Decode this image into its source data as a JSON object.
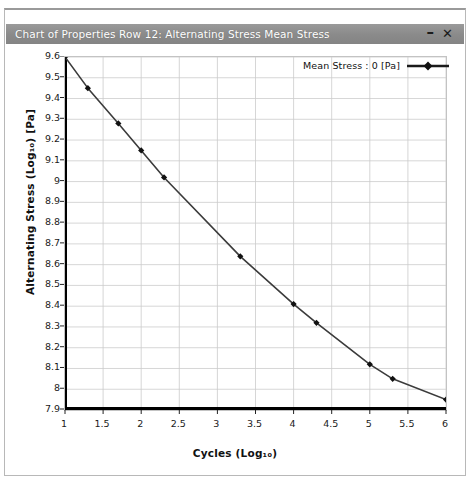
{
  "window": {
    "title": "Chart of Properties Row 12: Alternating Stress Mean Stress",
    "minimize_label": "–",
    "close_label": "✕"
  },
  "chart_data": {
    "type": "line",
    "title": "Chart of Properties Row 12: Alternating Stress Mean Stress",
    "xlabel": "Cycles (Log₁₀)",
    "ylabel": "Alternating Stress (Log₁₀) [Pa]",
    "xlim": [
      1,
      6
    ],
    "ylim": [
      7.9,
      9.6
    ],
    "xticks": [
      1,
      1.5,
      2,
      2.5,
      3,
      3.5,
      4,
      4.5,
      5,
      5.5,
      6
    ],
    "xticklabels": [
      "1",
      "1.5",
      "2",
      "2.5",
      "3",
      "3.5",
      "4",
      "4.5",
      "5",
      "5.5",
      "6"
    ],
    "yticks": [
      7.9,
      8,
      8.1,
      8.2,
      8.3,
      8.4,
      8.5,
      8.6,
      8.7,
      8.8,
      8.9,
      9,
      9.1,
      9.2,
      9.3,
      9.4,
      9.5,
      9.6
    ],
    "yticklabels": [
      "7.9",
      "8",
      "8.1",
      "8.2",
      "8.3",
      "8.4",
      "8.5",
      "8.6",
      "8.7",
      "8.8",
      "8.9",
      "9",
      "9.1",
      "9.2",
      "9.3",
      "9.4",
      "9.5",
      "9.6"
    ],
    "grid": true,
    "legend_position": "top-right",
    "series": [
      {
        "name": "Mean Stress : 0 [Pa]",
        "color": "#3b3b3b",
        "marker": "diamond",
        "marker_color": "#111111",
        "x": [
          1.0,
          1.3,
          1.7,
          2.0,
          2.3,
          3.3,
          4.0,
          4.3,
          5.0,
          5.3,
          6.0
        ],
        "y": [
          9.6,
          9.45,
          9.28,
          9.15,
          9.02,
          8.64,
          8.41,
          8.32,
          8.12,
          8.05,
          7.95
        ]
      }
    ]
  },
  "legend": {
    "entries": [
      {
        "label": "Mean Stress : 0 [Pa]"
      }
    ]
  },
  "colors": {
    "titlebar": "#8c8c8c",
    "titlebar_text": "#ffffff",
    "grid": "#c9c9c9",
    "axis": "#000000",
    "series": "#3b3b3b",
    "background": "#ffffff"
  }
}
